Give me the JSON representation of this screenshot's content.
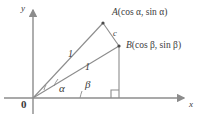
{
  "figure": {
    "background_color": "#ffffff",
    "stroke_color": "#8c8c8c",
    "text_color": "#3b3b3b",
    "axes": {
      "x_label": "x",
      "y_label": "y",
      "origin_label": "0"
    },
    "points": [
      {
        "name": "A",
        "label": "A",
        "coordinates_text": "(cos α, sin α)",
        "x": 103,
        "y": 23
      },
      {
        "name": "B",
        "label": "B",
        "coordinates_text": "(cos β, sin β)",
        "x": 119,
        "y": 46
      }
    ],
    "segments": [
      {
        "name": "OA",
        "length_label": "1"
      },
      {
        "name": "OB",
        "length_label": "1"
      },
      {
        "name": "AB",
        "length_label": "c"
      }
    ],
    "angles": [
      {
        "name": "alpha",
        "label": "α"
      },
      {
        "name": "beta",
        "label": "β"
      }
    ],
    "markers": {
      "right_angle": "right-angle-square"
    }
  }
}
